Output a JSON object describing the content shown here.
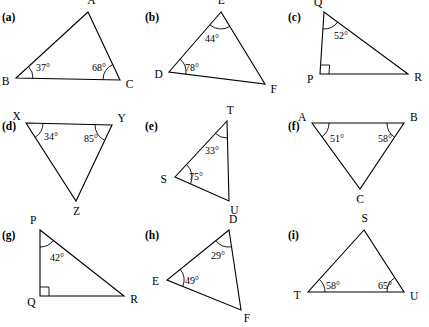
{
  "page": {
    "background": "#ffffff",
    "stroke_color": "#000000"
  },
  "items": [
    {
      "part": "(a)",
      "vertices": [
        {
          "name": "A",
          "x": 88,
          "y": 12
        },
        {
          "name": "B",
          "x": 16,
          "y": 78
        },
        {
          "name": "C",
          "x": 120,
          "y": 80
        }
      ],
      "angles": [
        {
          "at": "B",
          "value": "37°",
          "x": 36,
          "y": 62
        },
        {
          "at": "C",
          "value": "68°",
          "x": 92,
          "y": 62
        }
      ],
      "right_angle_at": null
    },
    {
      "part": "(b)",
      "vertices": [
        {
          "name": "E",
          "x": 78,
          "y": 12
        },
        {
          "name": "D",
          "x": 26,
          "y": 72
        },
        {
          "name": "F",
          "x": 122,
          "y": 84
        }
      ],
      "angles": [
        {
          "at": "E",
          "value": "44°",
          "x": 62,
          "y": 33
        },
        {
          "at": "D",
          "value": "78°",
          "x": 42,
          "y": 62
        }
      ],
      "right_angle_at": null
    },
    {
      "part": "(c)",
      "vertices": [
        {
          "name": "Q",
          "x": 38,
          "y": 12
        },
        {
          "name": "P",
          "x": 34,
          "y": 74
        },
        {
          "name": "R",
          "x": 122,
          "y": 74
        }
      ],
      "angles": [
        {
          "at": "Q",
          "value": "52°",
          "x": 48,
          "y": 30
        }
      ],
      "right_angle_at": "P"
    },
    {
      "part": "(d)",
      "vertices": [
        {
          "name": "X",
          "x": 26,
          "y": 14
        },
        {
          "name": "Y",
          "x": 112,
          "y": 16
        },
        {
          "name": "Z",
          "x": 76,
          "y": 92
        }
      ],
      "angles": [
        {
          "at": "X",
          "value": "34°",
          "x": 44,
          "y": 22
        },
        {
          "at": "Y",
          "value": "85°",
          "x": 84,
          "y": 24
        }
      ],
      "right_angle_at": null
    },
    {
      "part": "(e)",
      "vertices": [
        {
          "name": "T",
          "x": 84,
          "y": 12
        },
        {
          "name": "S",
          "x": 32,
          "y": 68
        },
        {
          "name": "U",
          "x": 86,
          "y": 92
        }
      ],
      "angles": [
        {
          "at": "T",
          "value": "33°",
          "x": 62,
          "y": 36
        },
        {
          "at": "S",
          "value": "75°",
          "x": 46,
          "y": 62
        }
      ],
      "right_angle_at": null
    },
    {
      "part": "(f)",
      "vertices": [
        {
          "name": "A",
          "x": 26,
          "y": 14
        },
        {
          "name": "B",
          "x": 118,
          "y": 14
        },
        {
          "name": "C",
          "x": 74,
          "y": 80
        }
      ],
      "angles": [
        {
          "at": "A",
          "value": "51°",
          "x": 44,
          "y": 24
        },
        {
          "at": "B",
          "value": "58°",
          "x": 92,
          "y": 24
        }
      ],
      "right_angle_at": null
    },
    {
      "part": "(g)",
      "vertices": [
        {
          "name": "P",
          "x": 40,
          "y": 12
        },
        {
          "name": "Q",
          "x": 40,
          "y": 78
        },
        {
          "name": "R",
          "x": 124,
          "y": 78
        }
      ],
      "angles": [
        {
          "at": "P",
          "value": "42°",
          "x": 50,
          "y": 34
        }
      ],
      "right_angle_at": "Q"
    },
    {
      "part": "(h)",
      "vertices": [
        {
          "name": "D",
          "x": 86,
          "y": 12
        },
        {
          "name": "E",
          "x": 24,
          "y": 62
        },
        {
          "name": "F",
          "x": 98,
          "y": 92
        }
      ],
      "angles": [
        {
          "at": "D",
          "value": "29°",
          "x": 68,
          "y": 32
        },
        {
          "at": "E",
          "value": "49°",
          "x": 42,
          "y": 57
        }
      ],
      "right_angle_at": null
    },
    {
      "part": "(i)",
      "vertices": [
        {
          "name": "S",
          "x": 78,
          "y": 12
        },
        {
          "name": "T",
          "x": 22,
          "y": 74
        },
        {
          "name": "U",
          "x": 118,
          "y": 74
        }
      ],
      "angles": [
        {
          "at": "T",
          "value": "58°",
          "x": 40,
          "y": 62
        },
        {
          "at": "U",
          "value": "65°",
          "x": 92,
          "y": 62
        }
      ],
      "right_angle_at": null
    }
  ]
}
